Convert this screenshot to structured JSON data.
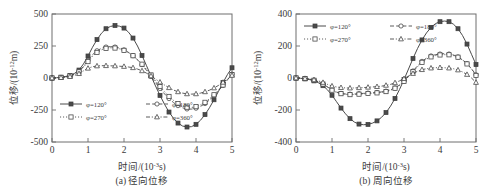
{
  "figure": {
    "background": "#ffffff",
    "line_color": "#4a4a4a",
    "axis_color": "#6e6e6e"
  },
  "chart_data": [
    {
      "type": "line",
      "panel_id": "a",
      "title": "",
      "caption": "(a) 径向位移",
      "xlabel_main": "时间/(10",
      "xlabel_exp": "-3",
      "xlabel_tail": "s)",
      "ylabel_main": "位移/(10",
      "ylabel_exp": "-12",
      "ylabel_tail": "m)",
      "xlim": [
        0,
        5
      ],
      "ylim": [
        -500,
        500
      ],
      "xticks": [
        "0",
        "1",
        "2",
        "3",
        "4",
        "5"
      ],
      "xtick_values": [
        0,
        1,
        2,
        3,
        4,
        5
      ],
      "yticks": [
        "500",
        "250",
        "0",
        "-250",
        "-500"
      ],
      "ytick_values": [
        500,
        250,
        0,
        -250,
        -500
      ],
      "grid": false,
      "legend_position": "lower-left",
      "x": [
        0,
        0.125,
        0.25,
        0.375,
        0.5,
        0.625,
        0.75,
        0.875,
        1.0,
        1.125,
        1.25,
        1.375,
        1.5,
        1.625,
        1.75,
        1.875,
        2.0,
        2.125,
        2.25,
        2.375,
        2.5,
        2.625,
        2.75,
        2.875,
        3.0,
        3.125,
        3.25,
        3.375,
        3.5,
        3.625,
        3.75,
        3.875,
        4.0,
        4.125,
        4.25,
        4.375,
        4.5,
        4.625,
        4.75,
        4.875,
        5.0
      ],
      "series": [
        {
          "name": "φ=120°",
          "label_prefix": "φ=",
          "label_value": "120°",
          "line_style": "solid",
          "marker": "filled-square",
          "values": [
            0,
            2,
            6,
            12,
            20,
            36,
            62,
            110,
            172,
            240,
            300,
            350,
            385,
            403,
            410,
            405,
            390,
            358,
            312,
            250,
            176,
            96,
            16,
            -62,
            -136,
            -205,
            -266,
            -315,
            -352,
            -375,
            -383,
            -380,
            -362,
            -330,
            -286,
            -232,
            -170,
            -104,
            -36,
            28,
            80
          ]
        },
        {
          "name": "φ=180°",
          "label_prefix": "φ=",
          "label_value": "180°",
          "line_style": "dashed",
          "marker": "circle",
          "values": [
            0,
            2,
            5,
            10,
            17,
            30,
            52,
            90,
            138,
            182,
            213,
            232,
            242,
            245,
            242,
            234,
            220,
            200,
            174,
            142,
            104,
            60,
            12,
            -36,
            -82,
            -124,
            -161,
            -192,
            -216,
            -233,
            -242,
            -243,
            -236,
            -222,
            -200,
            -172,
            -138,
            -100,
            -58,
            -14,
            30
          ]
        },
        {
          "name": "φ=270°",
          "label_prefix": "φ=",
          "label_value": "270°",
          "line_style": "dotted",
          "marker": "open-square",
          "values": [
            0,
            2,
            5,
            9,
            16,
            28,
            48,
            84,
            128,
            170,
            200,
            220,
            232,
            236,
            234,
            228,
            216,
            198,
            174,
            144,
            108,
            68,
            24,
            -22,
            -66,
            -107,
            -144,
            -175,
            -200,
            -218,
            -228,
            -230,
            -224,
            -210,
            -190,
            -163,
            -131,
            -95,
            -55,
            -14,
            26
          ]
        },
        {
          "name": "φ=360°",
          "label_prefix": "φ=",
          "label_value": "360°",
          "line_style": "dash-dot",
          "marker": "triangle",
          "values": [
            0,
            1,
            3,
            6,
            11,
            20,
            34,
            56,
            76,
            88,
            94,
            96,
            96,
            95,
            94,
            92,
            90,
            86,
            80,
            70,
            56,
            38,
            16,
            -8,
            -32,
            -55,
            -76,
            -94,
            -108,
            -118,
            -124,
            -126,
            -124,
            -118,
            -108,
            -95,
            -78,
            -58,
            -34,
            -8,
            20
          ]
        }
      ]
    },
    {
      "type": "line",
      "panel_id": "b",
      "title": "",
      "caption": "(b) 周向位移",
      "xlabel_main": "时间/(10",
      "xlabel_exp": "-3",
      "xlabel_tail": "s)",
      "ylabel_main": "位移/(10",
      "ylabel_exp": "-12",
      "ylabel_tail": "m)",
      "xlim": [
        0,
        5
      ],
      "ylim": [
        -400,
        400
      ],
      "xticks": [
        "0",
        "1",
        "2",
        "3",
        "4",
        "5"
      ],
      "xtick_values": [
        0,
        1,
        2,
        3,
        4,
        5
      ],
      "yticks": [
        "400",
        "200",
        "0",
        "-200",
        "-400"
      ],
      "ytick_values": [
        400,
        200,
        0,
        -200,
        -400
      ],
      "grid": false,
      "legend_position": "upper-left",
      "x": [
        0,
        0.125,
        0.25,
        0.375,
        0.5,
        0.625,
        0.75,
        0.875,
        1.0,
        1.125,
        1.25,
        1.375,
        1.5,
        1.625,
        1.75,
        1.875,
        2.0,
        2.125,
        2.25,
        2.375,
        2.5,
        2.625,
        2.75,
        2.875,
        3.0,
        3.125,
        3.25,
        3.375,
        3.5,
        3.625,
        3.75,
        3.875,
        4.0,
        4.125,
        4.25,
        4.375,
        4.5,
        4.625,
        4.75,
        4.875,
        5.0
      ],
      "series": [
        {
          "name": "φ=120°",
          "label_prefix": "φ=",
          "label_value": "120°",
          "line_style": "solid",
          "marker": "filled-square",
          "values": [
            0,
            -2,
            -5,
            -10,
            -18,
            -30,
            -48,
            -74,
            -108,
            -148,
            -188,
            -224,
            -254,
            -276,
            -288,
            -292,
            -290,
            -282,
            -268,
            -246,
            -216,
            -176,
            -128,
            -72,
            -10,
            56,
            122,
            184,
            238,
            282,
            316,
            340,
            352,
            356,
            352,
            336,
            308,
            266,
            212,
            148,
            84
          ]
        },
        {
          "name": "φ=180°",
          "label_prefix": "φ=",
          "label_value": "180°",
          "line_style": "dashed",
          "marker": "circle",
          "values": [
            0,
            -1,
            -4,
            -8,
            -14,
            -24,
            -38,
            -56,
            -74,
            -88,
            -96,
            -100,
            -101,
            -100,
            -98,
            -96,
            -94,
            -92,
            -90,
            -87,
            -82,
            -74,
            -62,
            -44,
            -20,
            10,
            44,
            76,
            104,
            124,
            138,
            146,
            150,
            152,
            150,
            144,
            132,
            114,
            90,
            58,
            20
          ]
        },
        {
          "name": "φ=270°",
          "label_prefix": "φ=",
          "label_value": "270°",
          "line_style": "dotted",
          "marker": "open-square",
          "values": [
            0,
            -1,
            -4,
            -8,
            -14,
            -24,
            -38,
            -56,
            -76,
            -90,
            -98,
            -102,
            -104,
            -103,
            -101,
            -99,
            -97,
            -95,
            -93,
            -90,
            -85,
            -76,
            -64,
            -46,
            -22,
            8,
            40,
            70,
            98,
            118,
            132,
            140,
            144,
            146,
            145,
            140,
            130,
            112,
            88,
            56,
            16
          ]
        },
        {
          "name": "φ=360°",
          "label_prefix": "φ=",
          "label_value": "360°",
          "line_style": "dash-dot",
          "marker": "triangle",
          "values": [
            0,
            -1,
            -3,
            -6,
            -11,
            -18,
            -28,
            -40,
            -50,
            -56,
            -60,
            -62,
            -63,
            -62,
            -61,
            -60,
            -58,
            -56,
            -54,
            -51,
            -46,
            -40,
            -30,
            -18,
            -4,
            12,
            28,
            42,
            52,
            58,
            62,
            64,
            65,
            64,
            62,
            58,
            50,
            38,
            22,
            0,
            -28
          ]
        }
      ]
    }
  ]
}
